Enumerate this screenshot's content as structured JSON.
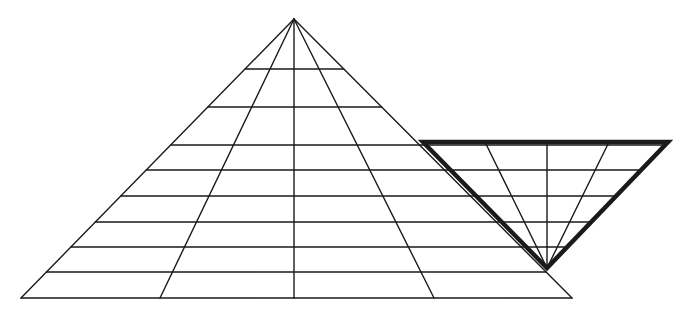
{
  "diagram": {
    "type": "triangle-counting-puzzle",
    "background": "#ffffff",
    "stroke_color": "#1a1a1a",
    "large_triangle": {
      "apex": [
        294,
        19
      ],
      "base_left": [
        21,
        298
      ],
      "base_right": [
        572,
        298
      ],
      "stroke_width": 1.4,
      "horizontal_lines_y": [
        69,
        107,
        145,
        170,
        196,
        222,
        247,
        272
      ],
      "ray_base_x": [
        21,
        160,
        294,
        434,
        572
      ]
    },
    "highlighted_inverted_triangle": {
      "top_left": [
        423,
        142
      ],
      "top_right": [
        668,
        142
      ],
      "bottom": [
        547,
        268
      ],
      "stroke_width": 4.5,
      "inner_rays_top_x": [
        485,
        547,
        609
      ]
    }
  }
}
